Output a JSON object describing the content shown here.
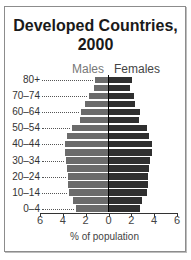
{
  "chart_data": {
    "type": "bar",
    "subtype": "population-pyramid",
    "title": "Developed Countries, 2000",
    "title_lines": [
      "Developed Countries,",
      "2000"
    ],
    "xlabel": "% of population",
    "ylabel": "",
    "categories": [
      "0–4",
      "5–9",
      "10–14",
      "15–19",
      "20–24",
      "25–29",
      "30–34",
      "35–39",
      "40–44",
      "45–49",
      "50–54",
      "55–59",
      "60–64",
      "65–69",
      "70–74",
      "75–79",
      "80+"
    ],
    "visible_y_tick_labels": [
      "80+",
      "70–74",
      "60–64",
      "50–54",
      "40–44",
      "30–34",
      "20–24",
      "10–14",
      "0–4"
    ],
    "series": [
      {
        "name": "Males",
        "side": "left",
        "color": "#6b6b6b",
        "values": [
          2.8,
          3.1,
          3.4,
          3.5,
          3.5,
          3.6,
          3.7,
          3.8,
          3.8,
          3.6,
          3.2,
          2.5,
          2.4,
          2.0,
          1.7,
          1.2,
          1.1
        ]
      },
      {
        "name": "Females",
        "side": "right",
        "color": "#2f2f2f",
        "values": [
          2.7,
          2.9,
          3.3,
          3.4,
          3.4,
          3.5,
          3.6,
          3.8,
          3.8,
          3.5,
          3.3,
          2.6,
          2.7,
          2.3,
          2.2,
          1.8,
          2.0
        ]
      }
    ],
    "x_ticks": [
      6,
      4,
      2,
      0,
      2,
      4,
      6
    ],
    "xlim": [
      -6,
      6
    ],
    "grid": false,
    "legend": {
      "entries": [
        "Males",
        "Females"
      ],
      "position": "top-center"
    }
  }
}
